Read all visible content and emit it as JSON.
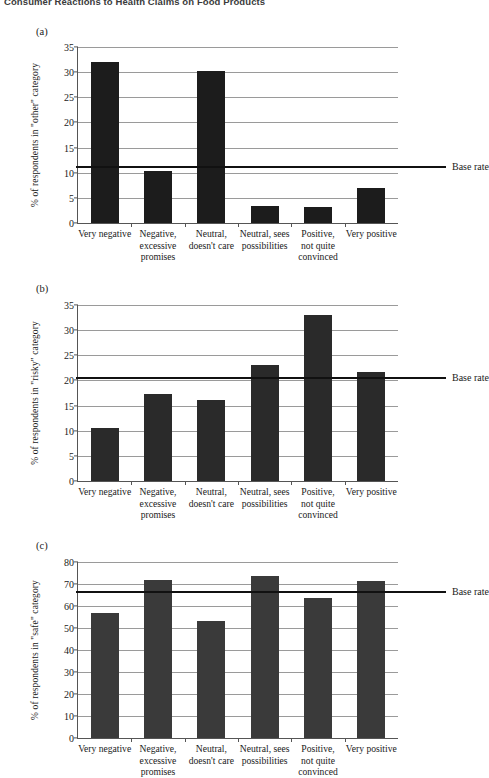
{
  "running_header": "Consumer Reactions to Health Claims on Food Products",
  "base_rate_label": "Base rate",
  "categories": [
    "Very negative",
    "Negative,\nexcessive\npromises",
    "Neutral,\ndoesn't care",
    "Neutral, sees\npossibilities",
    "Positive,\nnot quite\nconvinced",
    "Very positive"
  ],
  "panels": [
    {
      "tag": "(a)",
      "ylabel": "% of respondents in \"other\" category",
      "yticks": [
        0,
        5,
        10,
        15,
        20,
        25,
        30,
        35
      ]
    },
    {
      "tag": "(b)",
      "ylabel": "% of respondents in \"risky\" category",
      "yticks": [
        0,
        5,
        10,
        15,
        20,
        25,
        30,
        35
      ]
    },
    {
      "tag": "(c)",
      "ylabel": "% of respondents in \"safe\" category",
      "yticks": [
        0,
        10,
        20,
        30,
        40,
        50,
        60,
        70,
        80
      ]
    }
  ],
  "chart_data": [
    {
      "type": "bar",
      "panel": "(a)",
      "title": "",
      "xlabel": "",
      "ylabel": "% of respondents in \"other\" category",
      "categories": [
        "Very negative",
        "Negative, excessive promises",
        "Neutral, doesn't care",
        "Neutral, sees possibilities",
        "Positive, not quite convinced",
        "Very positive"
      ],
      "values": [
        32.0,
        10.3,
        30.2,
        3.3,
        3.2,
        7.0
      ],
      "ylim": [
        0,
        35
      ],
      "yticks": [
        0,
        5,
        10,
        15,
        20,
        25,
        30,
        35
      ],
      "grid": true,
      "annotations": [
        {
          "name": "Base rate",
          "type": "hline",
          "value": 11.4
        }
      ],
      "bar_color": "#1c1c1c"
    },
    {
      "type": "bar",
      "panel": "(b)",
      "title": "",
      "xlabel": "",
      "ylabel": "% of respondents in \"risky\" category",
      "categories": [
        "Very negative",
        "Negative, excessive promises",
        "Neutral, doesn't care",
        "Neutral, sees possibilities",
        "Positive, not quite convinced",
        "Very positive"
      ],
      "values": [
        10.6,
        17.3,
        16.1,
        23.0,
        33.0,
        21.7
      ],
      "ylim": [
        0,
        35
      ],
      "yticks": [
        0,
        5,
        10,
        15,
        20,
        25,
        30,
        35
      ],
      "grid": true,
      "annotations": [
        {
          "name": "Base rate",
          "type": "hline",
          "value": 20.6
        }
      ],
      "bar_color": "#2a2a2a"
    },
    {
      "type": "bar",
      "panel": "(c)",
      "title": "",
      "xlabel": "",
      "ylabel": "% of respondents in \"safe\" category",
      "categories": [
        "Very negative",
        "Negative, excessive promises",
        "Neutral, doesn't care",
        "Neutral, sees possibilities",
        "Positive, not quite convinced",
        "Very positive"
      ],
      "values": [
        57.0,
        72.0,
        53.3,
        73.5,
        63.5,
        71.5
      ],
      "ylim": [
        0,
        80
      ],
      "yticks": [
        0,
        10,
        20,
        30,
        40,
        50,
        60,
        70,
        80
      ],
      "grid": true,
      "annotations": [
        {
          "name": "Base rate",
          "type": "hline",
          "value": 67.0
        }
      ],
      "bar_color": "#3a3a3a"
    }
  ]
}
